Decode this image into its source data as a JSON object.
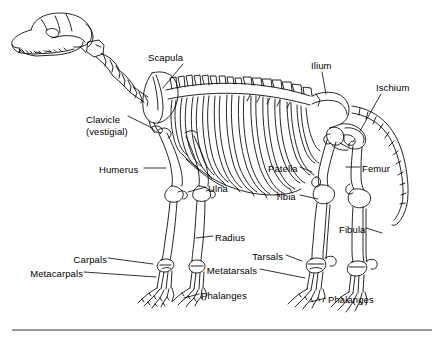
{
  "figure": {
    "view": "left lateral, facing left",
    "style": "black line art on white background",
    "line_color": "#000000",
    "background_color": "#ffffff",
    "rule": {
      "present": true,
      "x_start": 12,
      "x_end": 432,
      "y": 330,
      "color": "#7a7a7a"
    }
  },
  "labels": [
    {
      "id": "scapula",
      "text": "Scapula",
      "x": 148,
      "y": 52,
      "align": "left",
      "leader": true
    },
    {
      "id": "clavicle",
      "text": "Clavicle",
      "x": 86,
      "y": 114,
      "align": "left",
      "leader": true,
      "line2": "(vestigial)"
    },
    {
      "id": "humerus",
      "text": "Humerus",
      "x": 99,
      "y": 164,
      "align": "left",
      "leader": true
    },
    {
      "id": "ulna",
      "text": "Ulna",
      "x": 208,
      "y": 183,
      "align": "left",
      "leader": true
    },
    {
      "id": "radius",
      "text": "Radius",
      "x": 215,
      "y": 232,
      "align": "left",
      "leader": true
    },
    {
      "id": "carpals",
      "text": "Carpals",
      "x": 105,
      "y": 254,
      "align": "right",
      "leader": true
    },
    {
      "id": "metacarpals",
      "text": "Metacarpals",
      "x": 81,
      "y": 268,
      "align": "right",
      "leader": true
    },
    {
      "id": "phalanges-front",
      "text": "Phalanges",
      "x": 201,
      "y": 290,
      "align": "left",
      "leader": true
    },
    {
      "id": "ilium",
      "text": "Ilium",
      "x": 311,
      "y": 60,
      "align": "left",
      "leader": true
    },
    {
      "id": "ischium",
      "text": "Ischium",
      "x": 376,
      "y": 82,
      "align": "left",
      "leader": true
    },
    {
      "id": "patella",
      "text": "Patella",
      "x": 268,
      "y": 163,
      "align": "left",
      "leader": true
    },
    {
      "id": "femur",
      "text": "Femur",
      "x": 362,
      "y": 163,
      "align": "left",
      "leader": true
    },
    {
      "id": "tibia",
      "text": "Tibia",
      "x": 275,
      "y": 191,
      "align": "left",
      "leader": true
    },
    {
      "id": "fibula",
      "text": "Fibula",
      "x": 339,
      "y": 224,
      "align": "left",
      "leader": true
    },
    {
      "id": "tarsals",
      "text": "Tarsals",
      "x": 283,
      "y": 251,
      "align": "right",
      "leader": true
    },
    {
      "id": "metatarsals",
      "text": "Metatarsals",
      "x": 257,
      "y": 265,
      "align": "right",
      "leader": true
    },
    {
      "id": "phalanges-hind",
      "text": "Phalanges",
      "x": 328,
      "y": 294,
      "align": "left",
      "leader": true
    }
  ],
  "bone_groups": [
    "skull",
    "cervical-vertebrae",
    "scapula",
    "clavicle-vestigial",
    "humerus",
    "ribs",
    "sternum",
    "thoracic-vertebrae",
    "lumbar-vertebrae",
    "ulna",
    "radius",
    "carpals",
    "metacarpals",
    "phalanges",
    "ilium",
    "ischium",
    "sacrum",
    "caudal-vertebrae-tail",
    "femur",
    "patella",
    "tibia",
    "fibula",
    "tarsals",
    "metatarsals"
  ]
}
